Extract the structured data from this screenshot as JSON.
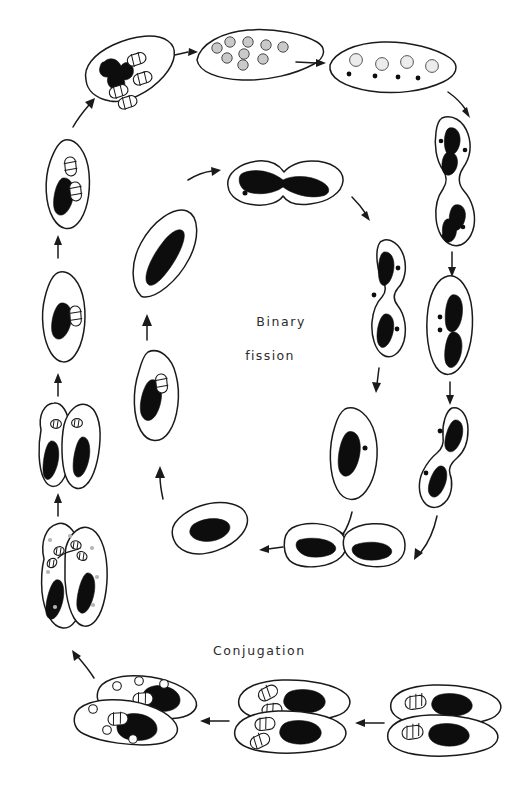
{
  "figure": {
    "width": 516,
    "height": 786,
    "background_color": "#ffffff",
    "ink_color": "#1a1a1a",
    "style": "hand-drawn line illustration"
  },
  "labels": {
    "binary_fission_line1": "Binary",
    "binary_fission_line2": "fission",
    "conjugation": "Conjugation"
  },
  "cycles": [
    {
      "name": "binary-fission",
      "label": "Binary fission",
      "position": "inner ring, center of figure",
      "direction": "counter-clockwise",
      "stage_count": 8
    },
    {
      "name": "conjugation",
      "label": "Conjugation",
      "position": "outer ring, perimeter of figure",
      "direction": "counter-clockwise",
      "stage_count": 13
    }
  ],
  "structures": {
    "macronucleus": "large solid black mass",
    "micronucleus": "small black dot or striped capsule",
    "nuclear_fragment": "gray shaded circle",
    "vacuole": "small open white circle"
  },
  "inner_stages": [
    {
      "id": "bf-1",
      "description": "elongated cell with slender macronucleus and two micronuclei",
      "macronuclei": 1,
      "micronuclei": 2
    },
    {
      "id": "bf-2",
      "description": "cell with stretched macronucleus spanning the cell",
      "macronuclei": 1,
      "micronuclei": 2
    },
    {
      "id": "bf-3",
      "description": "cell constricting at midline, macronucleus drawn out",
      "macronuclei": 1,
      "micronuclei": 2
    },
    {
      "id": "bf-4",
      "description": "cell nearly split, two daughter macronuclei",
      "macronuclei": 2,
      "micronuclei": 2
    },
    {
      "id": "bf-5",
      "description": "two daughter cells separating side by side",
      "macronuclei": 2,
      "micronuclei": 2
    },
    {
      "id": "bf-6",
      "description": "single daughter cell with compact macronucleus",
      "macronuclei": 1,
      "micronuclei": 1
    },
    {
      "id": "bf-7",
      "description": "daughter cell growing, macronucleus elongating",
      "macronuclei": 1,
      "micronuclei": 1
    },
    {
      "id": "bf-8",
      "description": "mature cell with single striped micronucleus",
      "macronuclei": 1,
      "micronuclei": 1
    }
  ],
  "outer_stages": [
    {
      "id": "cj-1",
      "description": "two conjugating cells joined, each with macronucleus and striped micronucleus",
      "position": "bottom right"
    },
    {
      "id": "cj-2",
      "description": "paired cells, micronuclei dividing into multiple capsules",
      "position": "bottom center"
    },
    {
      "id": "cj-3",
      "description": "paired cells with micronuclear products and vacuoles",
      "position": "bottom left"
    },
    {
      "id": "cj-4",
      "description": "exconjugant pair exchanging pronuclei across bridge",
      "position": "left lower"
    },
    {
      "id": "cj-5",
      "description": "separating cells, each with fused nucleus and macronucleus",
      "position": "left"
    },
    {
      "id": "cj-6",
      "description": "single exconjugant with macronucleus and micronucleus",
      "position": "left middle"
    },
    {
      "id": "cj-7",
      "description": "exconjugant with macronucleus and paired micronuclei",
      "position": "left upper"
    },
    {
      "id": "cj-8",
      "description": "cell with fragmenting macronucleus and four micronuclei",
      "position": "upper left"
    },
    {
      "id": "cj-9",
      "description": "cell filled with many gray macronuclear fragments",
      "position": "top center"
    },
    {
      "id": "cj-10",
      "description": "cell with four gray fragments and small dark micronuclei",
      "position": "top right"
    },
    {
      "id": "cj-11",
      "description": "dividing cell with two sets of nuclei",
      "position": "right upper"
    },
    {
      "id": "cj-12",
      "description": "cell with two macronuclei and two micronuclei",
      "position": "right"
    },
    {
      "id": "cj-13",
      "description": "dividing cell re-entering vegetative growth",
      "position": "right lower"
    }
  ]
}
